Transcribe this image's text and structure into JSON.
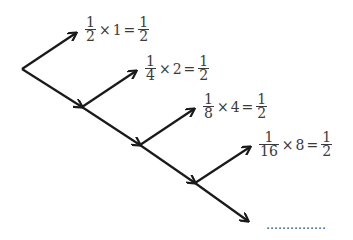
{
  "diagram": {
    "type": "branching-arrow-tree",
    "equations": [
      {
        "num": "1",
        "den": "2",
        "times": "×",
        "multiplier": "1",
        "equals": "=",
        "res_num": "1",
        "res_den": "2"
      },
      {
        "num": "1",
        "den": "4",
        "times": "×",
        "multiplier": "2",
        "equals": "=",
        "res_num": "1",
        "res_den": "2"
      },
      {
        "num": "1",
        "den": "8",
        "times": "×",
        "multiplier": "4",
        "equals": "=",
        "res_num": "1",
        "res_den": "2"
      },
      {
        "num": "1",
        "den": "16",
        "times": "×",
        "multiplier": "8",
        "equals": "=",
        "res_num": "1",
        "res_den": "2"
      }
    ],
    "continuation": "……………",
    "colors": {
      "arrow": "#1a1a1a",
      "text": "#3a3a3a",
      "background": "#ffffff"
    }
  }
}
